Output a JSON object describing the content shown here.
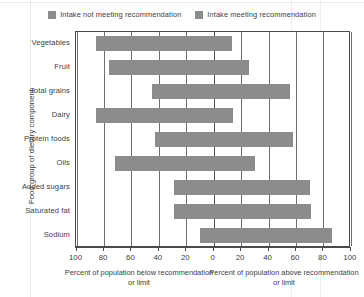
{
  "chart_data": {
    "type": "bar",
    "orientation": "horizontal",
    "layout": "diverging",
    "title": "",
    "ylabel": "Food group of dietary component",
    "xlabel_left": "Percent of population below recommendation or limit",
    "xlabel_right": "Percent of population above recommendation or limit",
    "grid": true,
    "legend_position": "top-center",
    "xlim": [
      -100,
      100
    ],
    "xtick_labels": [
      "100",
      "80",
      "60",
      "40",
      "20",
      "0",
      "20",
      "40",
      "60",
      "80",
      "100"
    ],
    "xtick_values": [
      -100,
      -80,
      -60,
      -40,
      -20,
      0,
      20,
      40,
      60,
      80,
      100
    ],
    "categories": [
      "Vegetables",
      "Fruit",
      "Total grains",
      "Dairy",
      "Protein foods",
      "Oils",
      "Added sugars",
      "Saturated fat",
      "Sodium"
    ],
    "series": [
      {
        "name": "Intake not meeting recommendation",
        "color": "#8c8c8c",
        "values": [
          86,
          76,
          45,
          86,
          43,
          72,
          29,
          29,
          10
        ]
      },
      {
        "name": "Intake meeting recommendation",
        "color": "#8c8c8c",
        "values": [
          13,
          26,
          56,
          14,
          58,
          30,
          70,
          71,
          86
        ]
      }
    ],
    "legend": [
      {
        "label": "Intake not meeting recommendation",
        "color": "#8c8c8c"
      },
      {
        "label": "Intake meeting recommendation",
        "color": "#8c8c8c"
      }
    ],
    "bars": [
      {
        "category": "Vegetables",
        "below": 86,
        "above": 13
      },
      {
        "category": "Fruit",
        "below": 76,
        "above": 26
      },
      {
        "category": "Total grains",
        "below": 45,
        "above": 56
      },
      {
        "category": "Dairy",
        "below": 86,
        "above": 14
      },
      {
        "category": "Protein foods",
        "below": 43,
        "above": 58
      },
      {
        "category": "Oils",
        "below": 72,
        "above": 30
      },
      {
        "category": "Added sugars",
        "below": 29,
        "above": 70
      },
      {
        "category": "Saturated fat",
        "below": 29,
        "above": 71
      },
      {
        "category": "Sodium",
        "below": 10,
        "above": 86
      }
    ]
  }
}
